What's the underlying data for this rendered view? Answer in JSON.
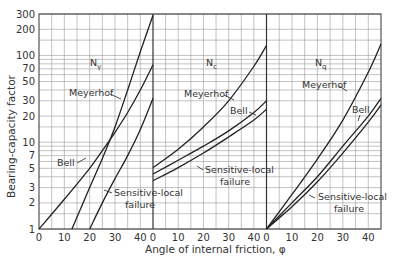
{
  "chart_data": {
    "type": "line",
    "title": "",
    "xlabel": "Angle of internal friction, φ",
    "ylabel": "Bearing-capacity factor",
    "yscale": "log",
    "ylim": [
      1,
      300
    ],
    "y_ticks": [
      1,
      2,
      3,
      5,
      7,
      10,
      20,
      30,
      50,
      70,
      100,
      200,
      300
    ],
    "x_ticks": [
      0,
      10,
      20,
      30,
      40
    ],
    "xlim": [
      0,
      45
    ],
    "grid": true,
    "panels": [
      {
        "name": "Nγ",
        "title": "Nγ",
        "series": [
          {
            "name": "Meyerhof",
            "x": [
              13,
              20,
              25,
              30,
              35,
              40,
              45
            ],
            "y": [
              1,
              3,
              6.5,
              15,
              40,
              110,
              290
            ]
          },
          {
            "name": "Bell",
            "x": [
              0,
              10,
              20,
              25,
              30,
              35,
              40,
              45
            ],
            "y": [
              1,
              2.2,
              5,
              8,
              13,
              22,
              40,
              78
            ]
          },
          {
            "name": "Sensitive-local failure",
            "x": [
              20,
              25,
              30,
              35,
              40,
              45
            ],
            "y": [
              1,
              2,
              3.8,
              7,
              14,
              32
            ]
          }
        ],
        "annotations": [
          "Meyerhof",
          "Bell",
          "Sensitive-local failure"
        ]
      },
      {
        "name": "Nc",
        "title": "Nc",
        "series": [
          {
            "name": "Meyerhof",
            "x": [
              0,
              10,
              20,
              30,
              40,
              45
            ],
            "y": [
              5.1,
              8.3,
              15,
              30,
              75,
              130
            ]
          },
          {
            "name": "Bell",
            "x": [
              0,
              10,
              20,
              30,
              40,
              45
            ],
            "y": [
              4.3,
              6.2,
              9,
              13.5,
              22,
              30
            ]
          },
          {
            "name": "Sensitive-local failure",
            "x": [
              0,
              10,
              20,
              30,
              40,
              45
            ],
            "y": [
              3.6,
              5.1,
              7.5,
              11.5,
              18,
              24
            ]
          }
        ],
        "annotations": [
          "Meyerhof",
          "Bell",
          "Sensitive-local failure"
        ]
      },
      {
        "name": "Nq",
        "title": "Nq",
        "series": [
          {
            "name": "Meyerhof",
            "x": [
              0,
              10,
              20,
              30,
              40,
              45
            ],
            "y": [
              1,
              2.5,
              6.4,
              18,
              64,
              135
            ]
          },
          {
            "name": "Bell",
            "x": [
              0,
              10,
              20,
              30,
              40,
              45
            ],
            "y": [
              1,
              2,
              4,
              9,
              20,
              32
            ]
          },
          {
            "name": "Sensitive-local failure",
            "x": [
              0,
              10,
              20,
              30,
              40,
              45
            ],
            "y": [
              1,
              1.8,
              3.5,
              7.5,
              17,
              27
            ]
          }
        ],
        "annotations": [
          "Meyerhof",
          "Bell",
          "Sensitive-local failure"
        ]
      }
    ],
    "legend": "none (curves labeled inline)"
  },
  "labels": {
    "ylabel": "Bearing-capacity factor",
    "xlabel": "Angle of internal friction, φ",
    "panel_titles": [
      "N",
      "N",
      "N"
    ],
    "panel_subs": [
      "γ",
      "c",
      "q"
    ],
    "meyerhof": "Meyerhof",
    "bell": "Bell",
    "sensitive_1": "Sensitive-local",
    "sensitive_2": "failure"
  },
  "colors": {
    "line": "#222222",
    "grid": "#9a9a9a",
    "frame": "#333333"
  }
}
